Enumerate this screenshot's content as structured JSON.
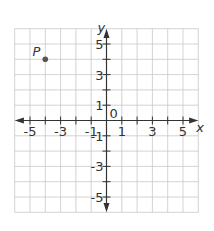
{
  "diagram": {
    "type": "coordinate-plane",
    "grid": {
      "x_min": -6,
      "x_max": 6,
      "y_min": -6,
      "y_max": 6,
      "step": 1
    },
    "axes": {
      "x_label": "x",
      "y_label": "y",
      "origin_label": "0",
      "x_tick_labels": [
        "-5",
        "-3",
        "-1",
        "1",
        "3",
        "5"
      ],
      "y_tick_labels": [
        "5",
        "3",
        "1",
        "-1",
        "-3",
        "-5"
      ]
    },
    "points": [
      {
        "label": "P",
        "x": -4,
        "y": 4
      }
    ],
    "colors": {
      "grid": "#c8c8c8",
      "axis": "#333333",
      "point": "#555555",
      "text": "#333333"
    }
  }
}
